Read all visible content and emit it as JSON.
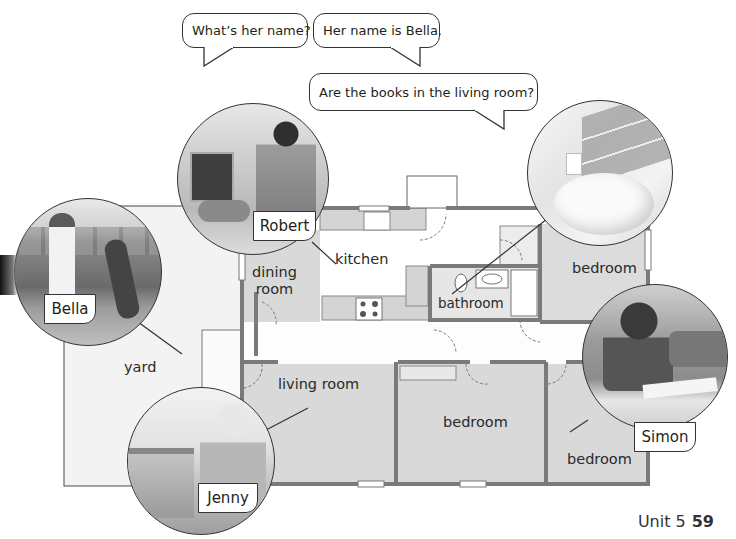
{
  "speech_bubbles": [
    {
      "id": "q1",
      "text": "What’s her name?"
    },
    {
      "id": "a1",
      "text": "Her name is Bella."
    },
    {
      "id": "q2",
      "text": "Are the books in  the living room?"
    }
  ],
  "rooms": {
    "kitchen": "kitchen",
    "dining_room_line1": "dining",
    "dining_room_line2": "room",
    "bathroom": "bathroom",
    "bedroom_top_right": "bedroom",
    "living_room": "living room",
    "bedroom_middle": "bedroom",
    "bedroom_bottom_right": "bedroom",
    "yard": "yard"
  },
  "people": [
    {
      "name": "Robert",
      "photo": "man-feeding-dog-in-kitchen"
    },
    {
      "name": "Bella",
      "photo": "girl-playing-frisbee-with-dog-in-yard"
    },
    {
      "name": "Jenny",
      "photo": "woman-by-fish-tank-in-living-room"
    },
    {
      "name": "Simon",
      "photo": "boy-reading-book-in-bedroom"
    }
  ],
  "bathroom_photo": "bathroom-sink",
  "footer": {
    "unit_label": "Unit 5",
    "page_number": "59"
  },
  "colors": {
    "wall": "#7a7a7a",
    "room_fill": "#d8d8d8",
    "yard_fill": "#f2f2f2",
    "hall_fill": "#ffffff",
    "line": "#333333"
  }
}
